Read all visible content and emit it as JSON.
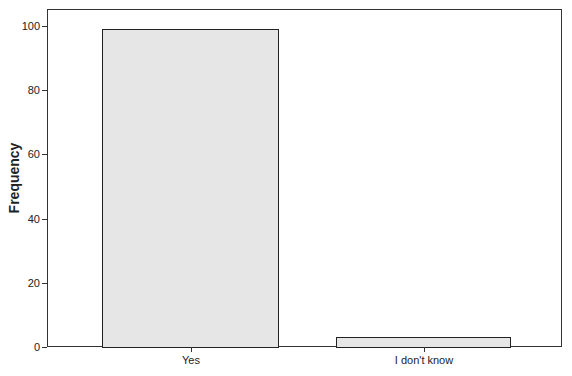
{
  "chart_data": {
    "type": "bar",
    "title": "",
    "xlabel": "",
    "ylabel": "Frequency",
    "categories": [
      "Yes",
      "I don't know"
    ],
    "values": [
      99,
      3
    ],
    "ylim": [
      0,
      105
    ],
    "yticks": [
      0,
      20,
      40,
      60,
      80,
      100
    ],
    "grid": false,
    "legend": null,
    "bar_color": "#e6e6e6",
    "edge_color": "#222222"
  }
}
